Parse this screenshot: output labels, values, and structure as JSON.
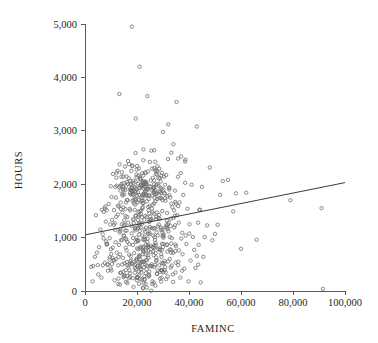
{
  "chart_data": {
    "type": "scatter",
    "title": "",
    "subtitle": "",
    "xlabel": "FAMINC",
    "ylabel": "HOURS",
    "xlim": [
      0,
      100000
    ],
    "ylim": [
      0,
      5000
    ],
    "grid": false,
    "legend": null,
    "legend_position": "none",
    "x_ticks": [
      0,
      20000,
      40000,
      60000,
      80000,
      100000
    ],
    "x_tick_labels": [
      "0",
      "20,000",
      "40,000",
      "60,000",
      "80,000",
      "100,000"
    ],
    "y_ticks": [
      0,
      1000,
      2000,
      3000,
      4000,
      5000
    ],
    "y_tick_labels": [
      "0",
      "1,000",
      "2,000",
      "3,000",
      "4,000",
      "5,000"
    ],
    "marker": "open-circle",
    "marker_color": "#6e6e6e",
    "axis_color": "#5a5a5a",
    "text_color": "#231f20",
    "n_points": 400,
    "annotations": [],
    "series": [
      {
        "name": "observations",
        "type": "scatter",
        "x": [
          2400,
          2900,
          3200,
          3800,
          4200,
          4600,
          5100,
          5400,
          5900,
          6300,
          6800,
          7200,
          7600,
          8000,
          8400,
          8800,
          9100,
          9500,
          9900,
          10200,
          10500,
          10800,
          11100,
          11400,
          11700,
          12000,
          12200,
          12500,
          12800,
          13000,
          13200,
          13400,
          13600,
          13800,
          14000,
          14200,
          14400,
          14600,
          14800,
          15000,
          15100,
          15200,
          15400,
          15500,
          15700,
          15800,
          16000,
          16100,
          16300,
          16400,
          16600,
          16700,
          16900,
          17000,
          17200,
          17300,
          17500,
          17600,
          17800,
          17900,
          18000,
          18100,
          18300,
          18400,
          18600,
          18700,
          18900,
          19000,
          19200,
          19300,
          19500,
          19600,
          19800,
          19900,
          20100,
          20200,
          20400,
          20500,
          20700,
          20800,
          21000,
          21100,
          21300,
          21400,
          21600,
          21700,
          21900,
          22000,
          22200,
          22300,
          22500,
          22600,
          22800,
          22900,
          23100,
          23200,
          23400,
          23500,
          23700,
          23800,
          24000,
          24100,
          24300,
          24400,
          24600,
          24700,
          24900,
          25000,
          25200,
          25300,
          25500,
          25600,
          25800,
          25900,
          26100,
          26200,
          26400,
          26500,
          26700,
          26800,
          27000,
          27100,
          27300,
          27400,
          27600,
          27700,
          27900,
          28000,
          28200,
          28300,
          28500,
          28600,
          28800,
          28900,
          29100,
          29200,
          29400,
          29500,
          29700,
          29800,
          30000,
          30200,
          30400,
          30600,
          30800,
          31000,
          31200,
          31400,
          31600,
          31800,
          32000,
          32200,
          32400,
          32600,
          32800,
          33000,
          33200,
          33400,
          33600,
          33800,
          34000,
          34300,
          34600,
          34900,
          35200,
          35500,
          35800,
          36100,
          36400,
          36700,
          37000,
          37400,
          37800,
          38200,
          38600,
          39000,
          39400,
          39800,
          40200,
          40600,
          41000,
          41500,
          42000,
          42500,
          43000,
          43500,
          44000,
          44500,
          45000,
          45500,
          46000,
          47000,
          48000,
          49000,
          50000,
          51000,
          52000,
          53000,
          55000,
          57000,
          58000,
          60000,
          62000,
          66000,
          79000,
          91000,
          91500
        ],
        "y": [
          450,
          180,
          470,
          640,
          1420,
          720,
          310,
          820,
          1150,
          250,
          1060,
          1480,
          530,
          1300,
          870,
          380,
          1630,
          990,
          420,
          1760,
          620,
          2190,
          1240,
          200,
          1950,
          1390,
          720,
          2250,
          480,
          1580,
          3690,
          120,
          1880,
          340,
          2140,
          960,
          1470,
          620,
          2020,
          280,
          1810,
          520,
          2330,
          1130,
          390,
          1960,
          760,
          2040,
          150,
          1700,
          1280,
          460,
          2110,
          880,
          1540,
          330,
          1990,
          650,
          2250,
          1080,
          4950,
          510,
          1870,
          240,
          2060,
          1340,
          710,
          1950,
          430,
          1620,
          3230,
          920,
          2180,
          580,
          1780,
          260,
          2010,
          1190,
          640,
          1930,
          4200,
          470,
          2090,
          830,
          1510,
          350,
          1970,
          1260,
          690,
          2160,
          2650,
          540,
          1840,
          210,
          2030,
          1110,
          760,
          1900,
          410,
          1680,
          3650,
          980,
          2240,
          620,
          1790,
          290,
          1960,
          1330,
          730,
          2070,
          2630,
          500,
          1880,
          180,
          2120,
          1040,
          670,
          1940,
          450,
          1740,
          2420,
          900,
          2190,
          560,
          1820,
          320,
          2000,
          1210,
          780,
          1970,
          2290,
          480,
          1860,
          230,
          2050,
          1150,
          640,
          1910,
          390,
          1700,
          2980,
          1060,
          1830,
          520,
          1990,
          350,
          2170,
          870,
          1460,
          270,
          3120,
          1280,
          1940,
          600,
          1750,
          440,
          2590,
          990,
          1570,
          310,
          2750,
          1190,
          1880,
          530,
          3540,
          1420,
          2480,
          760,
          1660,
          250,
          2520,
          1090,
          1800,
          420,
          2460,
          880,
          1540,
          180,
          1250,
          570,
          1990,
          1010,
          770,
          430,
          3080,
          1280,
          1520,
          160,
          1950,
          640,
          1010,
          1230,
          2310,
          950,
          1070,
          1240,
          1800,
          2060,
          2080,
          1490,
          1830,
          790,
          1840,
          960,
          1700,
          1550,
          40
        ]
      },
      {
        "name": "fitted-line",
        "type": "line",
        "x": [
          0,
          100000
        ],
        "y": [
          1050,
          2030
        ]
      }
    ]
  },
  "figure": {
    "background": "#ffffff",
    "plot_left_px": 85,
    "plot_right_px": 345,
    "plot_top_px": 24,
    "plot_bottom_px": 291
  }
}
